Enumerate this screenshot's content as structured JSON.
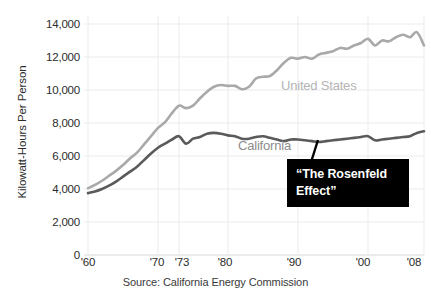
{
  "chart_data": {
    "type": "line",
    "title": "",
    "subtitle": "",
    "xlabel": "",
    "ylabel": "Kilowatt-Hours Per Person",
    "source": "Source: California Energy Commission",
    "xlim": [
      1960,
      2008
    ],
    "ylim": [
      0,
      14000
    ],
    "grid": true,
    "legend_position": "inline-annotations",
    "y_ticks": [
      14000,
      12000,
      10000,
      8000,
      6000,
      4000,
      2000,
      0
    ],
    "y_tick_labels": [
      "14,000",
      "12,000",
      "10,000",
      "8,000",
      "6,000",
      "4,000",
      "2,000",
      "0"
    ],
    "x_ticks": [
      1960,
      1970,
      1973,
      1980,
      1990,
      2000,
      2008
    ],
    "x_tick_labels": [
      "'60",
      "'70",
      "'73",
      "'80",
      "'90",
      "'00",
      "'08"
    ],
    "x": [
      1960,
      1961,
      1962,
      1963,
      1964,
      1965,
      1966,
      1967,
      1968,
      1969,
      1970,
      1971,
      1972,
      1973,
      1974,
      1975,
      1976,
      1977,
      1978,
      1979,
      1980,
      1981,
      1982,
      1983,
      1984,
      1985,
      1986,
      1987,
      1988,
      1989,
      1990,
      1991,
      1992,
      1993,
      1994,
      1995,
      1996,
      1997,
      1998,
      1999,
      2000,
      2001,
      2002,
      2003,
      2004,
      2005,
      2006,
      2007,
      2008
    ],
    "series": [
      {
        "name": "United States",
        "color": "#a9a9a9",
        "values": [
          4050,
          4250,
          4500,
          4800,
          5100,
          5450,
          5850,
          6200,
          6700,
          7200,
          7700,
          8050,
          8600,
          9050,
          8900,
          9050,
          9500,
          9900,
          10200,
          10300,
          10250,
          10250,
          10050,
          10200,
          10700,
          10800,
          10850,
          11200,
          11650,
          11950,
          11900,
          12000,
          11900,
          12150,
          12250,
          12350,
          12550,
          12500,
          12700,
          12850,
          13100,
          12700,
          13000,
          12950,
          13200,
          13350,
          13200,
          13500,
          12700
        ]
      },
      {
        "name": "California",
        "color": "#5a5a5a",
        "values": [
          3750,
          3850,
          4000,
          4200,
          4450,
          4750,
          5050,
          5350,
          5750,
          6150,
          6500,
          6750,
          7000,
          7200,
          6750,
          7050,
          7150,
          7350,
          7400,
          7350,
          7250,
          7200,
          7050,
          7050,
          7150,
          7200,
          7100,
          7000,
          6900,
          7000,
          7000,
          6950,
          6900,
          6850,
          6900,
          6950,
          7000,
          7050,
          7100,
          7150,
          7200,
          6950,
          7000,
          7050,
          7100,
          7150,
          7200,
          7400,
          7500
        ]
      }
    ],
    "annotations": [
      {
        "name": "united-states-label",
        "text": "United States",
        "color": "#b4b4b4"
      },
      {
        "name": "california-label",
        "text": "California",
        "color": "#8c8c8c"
      },
      {
        "name": "rosenfeld-callout",
        "text": "“The Rosenfeld Effect”",
        "line1": "“The Rosenfeld",
        "line2": "Effect”",
        "background": "#000000",
        "color": "#ffffff"
      }
    ]
  },
  "colors": {
    "background": "#ffffff",
    "grid": "#ebebeb",
    "text": "#2b2b2b",
    "us_line": "#a9a9a9",
    "ca_line": "#5a5a5a",
    "callout_bg": "#000000"
  }
}
